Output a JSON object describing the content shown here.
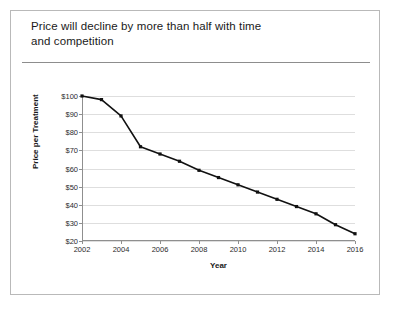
{
  "slide": {
    "title_lines": [
      "Price will decline by more than half with time",
      "and competition"
    ]
  },
  "chart_data": {
    "type": "line",
    "title": "",
    "xlabel": "Year",
    "ylabel": "Price per Treatment",
    "x": [
      2002,
      2003,
      2004,
      2005,
      2006,
      2007,
      2008,
      2009,
      2010,
      2011,
      2012,
      2013,
      2014,
      2015,
      2016
    ],
    "values": [
      100,
      98,
      89,
      72,
      68,
      64,
      59,
      55,
      51,
      47,
      43,
      39,
      35,
      29,
      24
    ],
    "xlim": [
      2002,
      2016
    ],
    "ylim": [
      20,
      100
    ],
    "ytick_values": [
      20,
      30,
      40,
      50,
      60,
      70,
      80,
      90,
      100
    ],
    "ytick_labels": [
      "$20",
      "$30",
      "$40",
      "$50",
      "$60",
      "$70",
      "$80",
      "$90",
      "$100"
    ],
    "xtick_values": [
      2002,
      2004,
      2006,
      2008,
      2010,
      2012,
      2014,
      2016
    ],
    "xtick_labels": [
      "2002",
      "2004",
      "2006",
      "2008",
      "2010",
      "2012",
      "2014",
      "2016"
    ],
    "grid": "horizontal",
    "legend": "none",
    "line_color": "#111111",
    "marker": "square",
    "grid_color": "#dedede",
    "axis_color": "#8f8f8f"
  }
}
